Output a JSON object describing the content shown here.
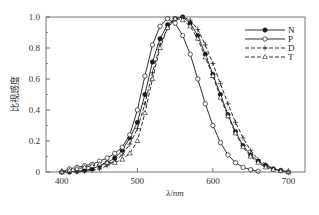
{
  "chart_data": {
    "type": "line",
    "title": "",
    "xlabel": "λ/nm",
    "ylabel": "比视感度",
    "xlim": [
      379,
      722
    ],
    "ylim": [
      0,
      1.0
    ],
    "xticks": [
      400,
      500,
      600,
      700
    ],
    "yticks": [
      0,
      0.2,
      0.4,
      0.6,
      0.8,
      1.0
    ],
    "ytick_labels": [
      "0",
      "0.2",
      "0.4",
      "0.6",
      "0.8",
      "1.0"
    ],
    "grid": false,
    "legend_position": "upper right",
    "x": [
      400,
      410,
      420,
      430,
      440,
      450,
      460,
      470,
      480,
      490,
      500,
      510,
      520,
      530,
      540,
      550,
      560,
      570,
      580,
      590,
      600,
      610,
      620,
      630,
      640,
      650,
      660,
      670,
      680,
      690,
      700
    ],
    "series": [
      {
        "name": "N",
        "marker": "filled-circle",
        "line": "solid",
        "values": [
          0.0,
          0.0,
          0.005,
          0.01,
          0.02,
          0.04,
          0.06,
          0.09,
          0.14,
          0.22,
          0.32,
          0.5,
          0.71,
          0.86,
          0.95,
          0.99,
          1.0,
          0.96,
          0.88,
          0.76,
          0.63,
          0.5,
          0.37,
          0.26,
          0.17,
          0.11,
          0.07,
          0.04,
          0.02,
          0.01,
          0.0
        ]
      },
      {
        "name": "P",
        "marker": "open-circle",
        "line": "solid",
        "values": [
          0.0,
          0.02,
          0.03,
          0.04,
          0.05,
          0.07,
          0.09,
          0.12,
          0.16,
          0.24,
          0.4,
          0.62,
          0.82,
          0.94,
          0.99,
          0.96,
          0.88,
          0.76,
          0.6,
          0.44,
          0.3,
          0.19,
          0.11,
          0.06,
          0.03,
          0.015,
          0.005,
          null,
          null,
          null,
          null
        ]
      },
      {
        "name": "D",
        "marker": "plus",
        "line": "dashed",
        "values": [
          0.0,
          0.0,
          0.0,
          0.005,
          0.01,
          0.02,
          0.04,
          0.07,
          0.11,
          0.18,
          0.28,
          0.44,
          0.64,
          0.82,
          0.93,
          0.99,
          1.0,
          0.98,
          0.92,
          0.82,
          0.7,
          0.57,
          0.44,
          0.32,
          0.22,
          0.14,
          0.08,
          0.05,
          0.02,
          0.01,
          0.0
        ]
      },
      {
        "name": "T",
        "marker": "open-triangle",
        "line": "dashed",
        "values": [
          0.0,
          0.01,
          0.02,
          0.03,
          0.04,
          0.05,
          0.06,
          0.06,
          0.08,
          0.12,
          0.2,
          0.38,
          0.6,
          0.8,
          0.93,
          0.99,
          0.98,
          0.94,
          0.86,
          0.74,
          0.62,
          0.48,
          0.36,
          0.25,
          0.16,
          0.1,
          0.06,
          0.03,
          0.015,
          0.005,
          0.0
        ]
      }
    ]
  },
  "legend": {
    "items": [
      {
        "label": "N"
      },
      {
        "label": "P"
      },
      {
        "label": "D"
      },
      {
        "label": "T"
      }
    ]
  },
  "colors": {
    "line": "#1a1a1a",
    "frame": "#555555",
    "background": "#ffffff"
  }
}
